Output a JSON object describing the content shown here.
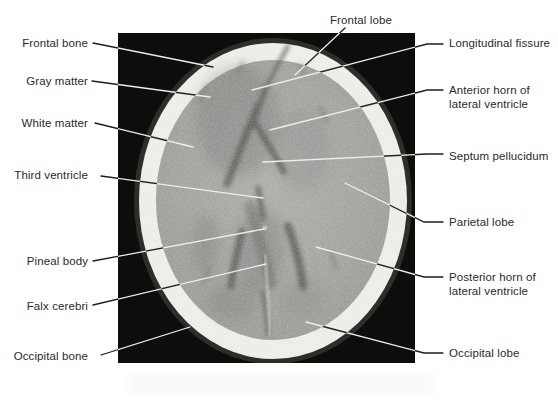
{
  "figure": {
    "description_labels_total": 14,
    "colors": {
      "page_background": "#ffffff",
      "scan_background": "#0d0d0c",
      "skull_bone": "#f1f0ec",
      "brain_tissue": "#a5a4a0",
      "leader_on_page": "#1e1e1e",
      "leader_on_scan": "#efeeec",
      "label_text": "#2a2a2a"
    },
    "scan": {
      "x": 118,
      "y": 33,
      "width": 297,
      "height": 330
    },
    "labels": [
      {
        "id": "frontal-bone",
        "lines": [
          "Frontal bone"
        ],
        "align": "right",
        "x": 88,
        "y": 43,
        "leader": [
          [
            93,
            43
          ],
          [
            213,
            67
          ]
        ]
      },
      {
        "id": "gray-matter",
        "lines": [
          "Gray matter"
        ],
        "align": "right",
        "x": 88,
        "y": 81,
        "leader": [
          [
            92,
            81
          ],
          [
            210,
            97
          ]
        ]
      },
      {
        "id": "white-matter",
        "lines": [
          "White matter"
        ],
        "align": "right",
        "x": 88,
        "y": 123,
        "leader": [
          [
            95,
            123
          ],
          [
            193,
            147
          ]
        ]
      },
      {
        "id": "third-ventricle",
        "lines": [
          "Third ventricle"
        ],
        "align": "right",
        "x": 88,
        "y": 175,
        "leader": [
          [
            101,
            176
          ],
          [
            263,
            198
          ]
        ]
      },
      {
        "id": "pineal-body",
        "lines": [
          "Pineal body"
        ],
        "align": "right",
        "x": 88,
        "y": 261,
        "leader": [
          [
            93,
            261
          ],
          [
            264,
            229
          ]
        ]
      },
      {
        "id": "falx-cerebri",
        "lines": [
          "Falx cerebri"
        ],
        "align": "right",
        "x": 88,
        "y": 306,
        "leader": [
          [
            93,
            305
          ],
          [
            266,
            264
          ]
        ]
      },
      {
        "id": "occipital-bone",
        "lines": [
          "Occipital bone"
        ],
        "align": "right",
        "x": 88,
        "y": 356,
        "leader": [
          [
            101,
            355
          ],
          [
            190,
            327
          ]
        ]
      },
      {
        "id": "frontal-lobe",
        "lines": [
          "Frontal lobe"
        ],
        "align": "left",
        "x": 330,
        "y": 20,
        "leader": [
          [
            345,
            28
          ],
          [
            295,
            75
          ]
        ]
      },
      {
        "id": "longitudinal-fissure",
        "lines": [
          "Longitudinal fissure"
        ],
        "align": "left",
        "x": 449,
        "y": 43,
        "leader": [
          [
            443,
            44
          ],
          [
            427,
            44
          ],
          [
            252,
            90
          ]
        ]
      },
      {
        "id": "anterior-horn",
        "lines": [
          "Anterior horn of",
          "lateral ventricle"
        ],
        "align": "left",
        "x": 449,
        "y": 90,
        "leader": [
          [
            443,
            90
          ],
          [
            427,
            90
          ],
          [
            270,
            130
          ]
        ]
      },
      {
        "id": "septum-pellucidum",
        "lines": [
          "Septum pellucidum"
        ],
        "align": "left",
        "x": 449,
        "y": 156,
        "leader": [
          [
            443,
            154
          ],
          [
            427,
            154
          ],
          [
            263,
            162
          ]
        ]
      },
      {
        "id": "parietal-lobe",
        "lines": [
          "Parietal lobe"
        ],
        "align": "left",
        "x": 449,
        "y": 222,
        "leader": [
          [
            443,
            222
          ],
          [
            424,
            222
          ],
          [
            345,
            183
          ]
        ]
      },
      {
        "id": "posterior-horn",
        "lines": [
          "Posterior horn of",
          "lateral ventricle"
        ],
        "align": "left",
        "x": 449,
        "y": 277,
        "leader": [
          [
            443,
            277
          ],
          [
            424,
            277
          ],
          [
            316,
            247
          ]
        ]
      },
      {
        "id": "occipital-lobe",
        "lines": [
          "Occipital lobe"
        ],
        "align": "left",
        "x": 449,
        "y": 353,
        "leader": [
          [
            443,
            353
          ],
          [
            424,
            353
          ],
          [
            306,
            322
          ]
        ]
      }
    ]
  }
}
